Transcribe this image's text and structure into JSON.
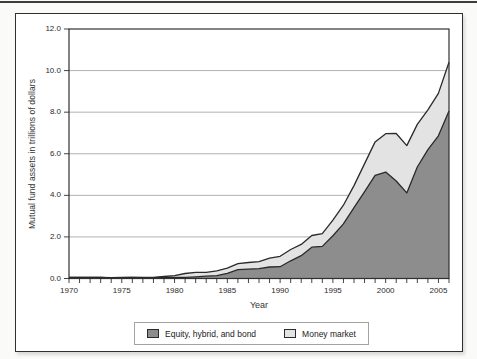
{
  "page": {
    "background": "#fafaf9",
    "top_rule_color": "#3d3d3d",
    "figure_background": "#ffffff",
    "figure_border_color": "#2f2f2f"
  },
  "chart_data": {
    "type": "area",
    "stacked": true,
    "title": "",
    "xlabel": "Year",
    "ylabel": "Mutual fund assets in trillions of dollars",
    "x": [
      1970,
      1971,
      1972,
      1973,
      1974,
      1975,
      1976,
      1977,
      1978,
      1979,
      1980,
      1981,
      1982,
      1983,
      1984,
      1985,
      1986,
      1987,
      1988,
      1989,
      1990,
      1991,
      1992,
      1993,
      1994,
      1995,
      1996,
      1997,
      1998,
      1999,
      2000,
      2001,
      2002,
      2003,
      2004,
      2005,
      2006
    ],
    "series": [
      {
        "name": "Equity, hybrid, and bond",
        "color": "#8d8d8d",
        "values": [
          0.048,
          0.055,
          0.06,
          0.047,
          0.036,
          0.042,
          0.048,
          0.045,
          0.045,
          0.049,
          0.058,
          0.055,
          0.077,
          0.113,
          0.137,
          0.251,
          0.424,
          0.453,
          0.472,
          0.553,
          0.568,
          0.851,
          1.096,
          1.505,
          1.544,
          2.058,
          2.624,
          3.409,
          4.174,
          4.958,
          5.119,
          4.69,
          4.118,
          5.362,
          6.194,
          6.865,
          8.059
        ]
      },
      {
        "name": "Money market",
        "color": "#e3e3e3",
        "values": [
          0.0,
          0.0,
          0.0,
          0.0,
          0.002,
          0.004,
          0.004,
          0.004,
          0.011,
          0.046,
          0.076,
          0.186,
          0.22,
          0.179,
          0.234,
          0.244,
          0.292,
          0.316,
          0.338,
          0.428,
          0.498,
          0.542,
          0.546,
          0.565,
          0.611,
          0.753,
          0.902,
          1.059,
          1.352,
          1.613,
          1.845,
          2.285,
          2.272,
          2.052,
          1.913,
          2.04,
          2.338
        ]
      }
    ],
    "x_range": [
      1970,
      2006
    ],
    "ylim": [
      0,
      12
    ],
    "x_tick_values": [
      1970,
      1975,
      1980,
      1985,
      1990,
      1995,
      2000,
      2005
    ],
    "x_tick_labels": [
      "1970",
      "1975",
      "1980",
      "1985",
      "1990",
      "1995",
      "2000",
      "2005"
    ],
    "x_minor_tick_step": 1,
    "y_tick_values": [
      0,
      2,
      4,
      6,
      8,
      10,
      12
    ],
    "y_tick_labels": [
      "0.0",
      "2.0",
      "4.0",
      "6.0",
      "8.0",
      "10.0",
      "12.0"
    ],
    "grid_y_values": [
      2,
      4,
      6,
      8,
      10
    ],
    "grid_on": true,
    "grid_color": "#8f8f8f",
    "line_color": "#2a2a2a",
    "frame_color": "#2f2f2f",
    "legend_position": "bottom"
  }
}
